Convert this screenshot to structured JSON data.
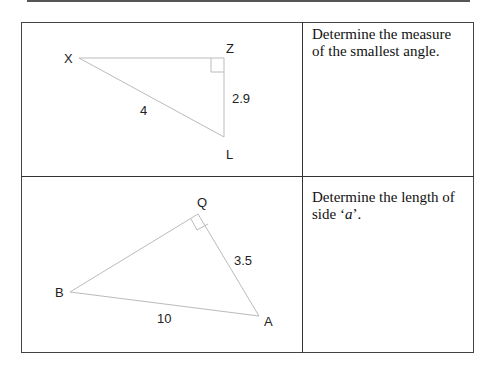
{
  "problems": [
    {
      "prompt": "Determine the measure of the smallest angle.",
      "triangle": {
        "vertices": [
          "X",
          "Z",
          "L"
        ],
        "right_angle_at": "Z",
        "side_labels": {
          "XL": "4",
          "ZL": "2.9"
        }
      }
    },
    {
      "prompt_prefix": "Determine the length of side ‘",
      "prompt_var": "a",
      "prompt_suffix": "’.",
      "triangle": {
        "vertices": [
          "Q",
          "B",
          "A"
        ],
        "right_angle_at": "Q",
        "side_labels": {
          "BA": "10",
          "QA": "3.5"
        }
      }
    }
  ]
}
